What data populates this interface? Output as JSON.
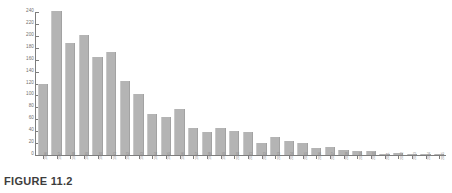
{
  "caption": {
    "label": "FIGURE 11.2"
  },
  "colors": {
    "bar_fill": "#b4b4b4",
    "axis": "#7d7d7d",
    "tick_text": "#6e6e6e",
    "caption_text": "#3d3d3d",
    "background": "#ffffff"
  },
  "chart_data": {
    "type": "bar",
    "title": "",
    "subtitle": "",
    "xlabel": "",
    "ylabel": "",
    "ylim": [
      0,
      240
    ],
    "ytick_step": 20,
    "grid": false,
    "legend": null,
    "ytick_labels": [
      "0",
      "20",
      "40",
      "60",
      "80",
      "100",
      "120",
      "140",
      "160",
      "180",
      "200",
      "220",
      "240"
    ],
    "ytick_values": [
      0,
      20,
      40,
      60,
      80,
      100,
      120,
      140,
      160,
      180,
      200,
      220,
      240
    ],
    "categories": [
      "1986",
      "1987",
      "1988",
      "1989",
      "1990",
      "1991",
      "1992",
      "1993",
      "1994",
      "1995",
      "1996",
      "1997",
      "1998",
      "1999",
      "2000",
      "2001",
      "2002",
      "2003",
      "2004",
      "2005",
      "2006",
      "2007",
      "2008",
      "2009",
      "2010",
      "2011",
      "2012",
      "2013",
      "2014",
      "2015"
    ],
    "values": [
      120,
      241,
      188,
      201,
      164,
      173,
      125,
      103,
      68,
      64,
      77,
      45,
      38,
      46,
      40,
      39,
      21,
      30,
      24,
      20,
      12,
      13,
      9,
      7,
      6,
      2,
      3,
      2,
      2,
      2
    ]
  }
}
